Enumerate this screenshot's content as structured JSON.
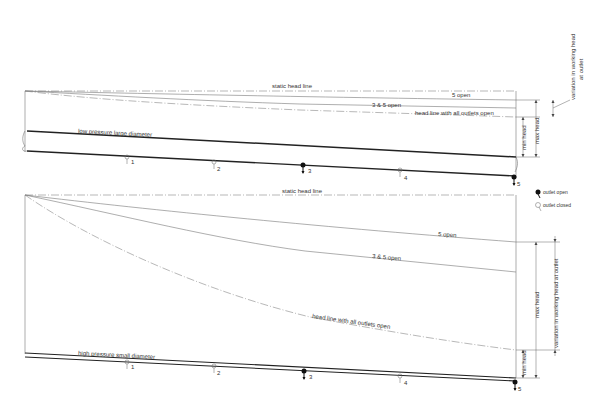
{
  "top_diagram": {
    "title": "low pressure large diameter",
    "static_head_label": "static head line",
    "curve_labels": {
      "five_open": "5 open",
      "three_five_open": "3 & 5 open",
      "all_open": "head line with all outlets open"
    },
    "dimension_labels": {
      "min_head": "min head",
      "max_head": "max head",
      "variation": "variation in working head",
      "variation_line2": "at outlet"
    },
    "outlets": [
      {
        "id": "1",
        "state": "closed"
      },
      {
        "id": "2",
        "state": "closed"
      },
      {
        "id": "3",
        "state": "open"
      },
      {
        "id": "4",
        "state": "closed"
      },
      {
        "id": "5",
        "state": "open"
      }
    ]
  },
  "bottom_diagram": {
    "title": "high pressure small diameter",
    "static_head_label": "static head line",
    "curve_labels": {
      "five_open": "5 open",
      "three_five_open": "3 & 5 open",
      "all_open": "head line with all outlets open"
    },
    "dimension_labels": {
      "min_head": "min head",
      "max_head": "max head",
      "variation": "variation in working head at outlet"
    },
    "outlets": [
      {
        "id": "1",
        "state": "closed"
      },
      {
        "id": "2",
        "state": "closed"
      },
      {
        "id": "3",
        "state": "open"
      },
      {
        "id": "4",
        "state": "closed"
      },
      {
        "id": "5",
        "state": "open"
      }
    ]
  },
  "legend": {
    "outlet_open": "outlet open",
    "outlet_closed": "outlet closed"
  }
}
